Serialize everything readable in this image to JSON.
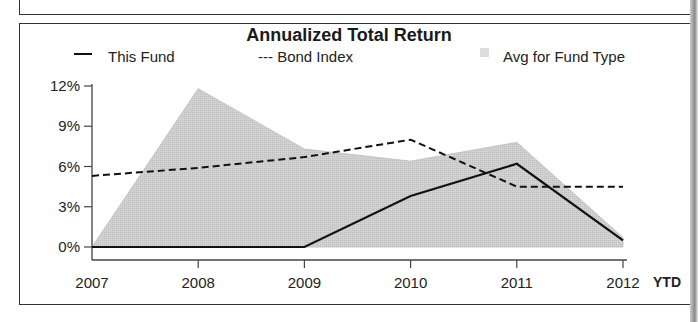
{
  "chart_data": {
    "type": "line",
    "title": "Annualized Total Return",
    "xlabel": "",
    "ylabel": "",
    "categories": [
      "2007",
      "2008",
      "2009",
      "2010",
      "2011",
      "2012"
    ],
    "x_extra_label": "YTD",
    "yticks": [
      "0%",
      "3%",
      "6%",
      "9%",
      "12%"
    ],
    "ylim": [
      0,
      12
    ],
    "grid": false,
    "legend_position": "top",
    "series": [
      {
        "name": "This Fund",
        "style": "solid line",
        "values": [
          0.0,
          0.0,
          0.0,
          3.8,
          6.2,
          0.5
        ]
      },
      {
        "name": "Bond Index",
        "style": "dashed line",
        "values": [
          5.3,
          5.9,
          6.7,
          8.0,
          4.5,
          4.5
        ]
      },
      {
        "name": "Avg for Fund Type",
        "style": "shaded area",
        "values": [
          0.0,
          11.8,
          7.3,
          6.4,
          7.8,
          0.7
        ]
      }
    ]
  },
  "legend": {
    "this_fund": "This Fund",
    "bond_index": "--- Bond Index",
    "avg": "Avg for Fund Type"
  },
  "colors": {
    "area": "#d4d4d4",
    "line": "#111111",
    "frame": "#333333"
  }
}
